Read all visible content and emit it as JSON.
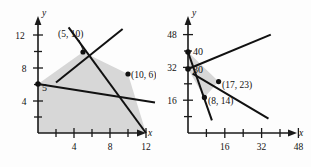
{
  "figure": {
    "background_color": "#fdfdfd",
    "region_fill_color": "#d7d7d7",
    "line_color": "#111111"
  },
  "chart_data": [
    {
      "id": "left-graph",
      "type": "line",
      "title": "",
      "xlabel": "x",
      "ylabel": "y",
      "xlim": [
        0,
        14
      ],
      "ylim": [
        0,
        14
      ],
      "xticks": [
        2,
        4,
        6,
        8,
        10,
        12
      ],
      "xtick_labels": [
        "",
        "4",
        "",
        "8",
        "",
        "12"
      ],
      "yticks": [
        2,
        4,
        6,
        8,
        10,
        12
      ],
      "ytick_labels": [
        "",
        "4",
        "",
        "8",
        "",
        "12"
      ],
      "grid": false,
      "legend": "none",
      "series": [
        {
          "name": "line-through-(0,5)-and-(10,6)",
          "points": [
            [
              0,
              5
            ],
            [
              13,
              3.7
            ]
          ]
        },
        {
          "name": "line-through-(5,10)-steep",
          "points": [
            [
              3.4,
              12.8
            ],
            [
              12,
              0
            ]
          ]
        },
        {
          "name": "line-through-(5,10)-to-upper-right",
          "points": [
            [
              2.0,
              6.2
            ],
            [
              9.4,
              12.6
            ]
          ]
        }
      ],
      "shaded_region": {
        "name": "feasible-region",
        "vertices": [
          [
            0,
            0
          ],
          [
            0,
            5
          ],
          [
            5,
            10
          ],
          [
            10,
            6
          ],
          [
            12,
            0
          ]
        ]
      },
      "annotations": [
        {
          "name": "vertex-5-10",
          "text": "(5, 10)",
          "point": [
            5,
            10
          ],
          "label_xy": [
            3.0,
            12.3
          ]
        },
        {
          "name": "vertex-10-6",
          "text": "(10, 6)",
          "point": [
            10,
            6
          ],
          "label_xy": [
            10.6,
            6.6
          ]
        },
        {
          "name": "intercept-5",
          "text": "5",
          "point": [
            0,
            5
          ],
          "label_xy": [
            0.45,
            4.55
          ]
        }
      ]
    },
    {
      "id": "right-graph",
      "type": "line",
      "title": "",
      "xlabel": "x",
      "ylabel": "y",
      "xlim": [
        0,
        56
      ],
      "ylim": [
        0,
        56
      ],
      "xticks": [
        8,
        16,
        24,
        32,
        40,
        48
      ],
      "xtick_labels": [
        "",
        "16",
        "",
        "32",
        "",
        "48"
      ],
      "yticks": [
        8,
        16,
        24,
        32,
        40,
        48
      ],
      "ytick_labels": [
        "",
        "16",
        "",
        "32",
        "",
        "48"
      ],
      "grid": false,
      "legend": "none",
      "series": [
        {
          "name": "line-through-(0,40)-and-(8,14)",
          "points": [
            [
              0,
              40
            ],
            [
              10.4,
              6.2
            ]
          ]
        },
        {
          "name": "line-through-(0,30)-rising",
          "points": [
            [
              0,
              30
            ],
            [
              36,
              48
            ]
          ]
        },
        {
          "name": "line-falling-through-(17,23)",
          "points": [
            [
              2.0,
              7.5
            ],
            [
              35,
              6.5
            ]
          ]
        }
      ],
      "shaded_region": {
        "name": "feasible-region",
        "vertices": [
          [
            0,
            40
          ],
          [
            17,
            23
          ],
          [
            8,
            14
          ],
          [
            0,
            30
          ]
        ]
      },
      "annotations": [
        {
          "name": "intercept-40",
          "text": "40",
          "point": [
            0,
            40
          ],
          "label_xy": [
            2.2,
            41.5
          ]
        },
        {
          "name": "intercept-30",
          "text": "30",
          "point": [
            0,
            30
          ],
          "label_xy": [
            2.2,
            31.5
          ]
        },
        {
          "name": "vertex-17-23",
          "text": "(17, 23)",
          "point": [
            17,
            23
          ],
          "label_xy": [
            19.0,
            22.0
          ]
        },
        {
          "name": "vertex-8-14",
          "text": "(8, 14)",
          "point": [
            8,
            14
          ],
          "label_xy": [
            10.0,
            12.4
          ]
        }
      ]
    }
  ]
}
